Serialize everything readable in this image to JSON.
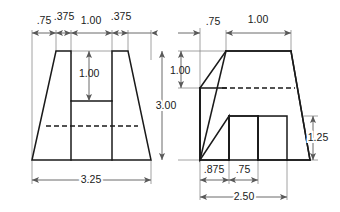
{
  "drawing": {
    "title": "Two-view orthographic dimensioned drawing",
    "units_note": "",
    "line_color": "#1a1a1a",
    "dim_color": "#595959",
    "ext_color": "#8c8c8c",
    "background": "#ffffff",
    "views": [
      {
        "id": "front-view",
        "name": "Front View",
        "description": "Trapezoid with rectangular slot cut from top center",
        "dimensions": [
          {
            "id": "fv-dim-075",
            "label": ".75",
            "orientation": "horizontal",
            "position": "top"
          },
          {
            "id": "fv-dim-375-l",
            "label": ".375",
            "orientation": "horizontal",
            "position": "top"
          },
          {
            "id": "fv-dim-100",
            "label": "1.00",
            "orientation": "horizontal",
            "position": "top"
          },
          {
            "id": "fv-dim-375-r",
            "label": ".375",
            "orientation": "horizontal",
            "position": "top"
          },
          {
            "id": "fv-dim-depth",
            "label": "1.00",
            "orientation": "vertical",
            "position": "interior"
          },
          {
            "id": "fv-dim-base",
            "label": "3.25",
            "orientation": "horizontal",
            "position": "bottom"
          }
        ]
      },
      {
        "id": "side-view",
        "name": "Side View",
        "description": "Trapezoid with step on left and rectangular notch in base",
        "dimensions": [
          {
            "id": "sv-dim-075",
            "label": ".75",
            "orientation": "horizontal",
            "position": "top"
          },
          {
            "id": "sv-dim-100-top",
            "label": "1.00",
            "orientation": "horizontal",
            "position": "top"
          },
          {
            "id": "sv-dim-100-v",
            "label": "1.00",
            "orientation": "vertical",
            "position": "left"
          },
          {
            "id": "sv-dim-300",
            "label": "3.00",
            "orientation": "vertical",
            "position": "left"
          },
          {
            "id": "sv-dim-125",
            "label": "1.25",
            "orientation": "vertical",
            "position": "right"
          },
          {
            "id": "sv-dim-0875",
            "label": ".875",
            "orientation": "horizontal",
            "position": "bottom"
          },
          {
            "id": "sv-dim-075-b",
            "label": ".75",
            "orientation": "horizontal",
            "position": "bottom"
          },
          {
            "id": "sv-dim-250",
            "label": "2.50",
            "orientation": "horizontal",
            "position": "bottom"
          }
        ]
      }
    ]
  },
  "labels": {
    "fv_075": ".75",
    "fv_375_left": ".375",
    "fv_100_top": "1.00",
    "fv_375_right": ".375",
    "fv_100_depth": "1.00",
    "fv_325": "3.25",
    "sv_075_top": ".75",
    "sv_100_top": "1.00",
    "sv_100_vert": "1.00",
    "sv_300": "3.00",
    "sv_125": "1.25",
    "sv_0875": ".875",
    "sv_075_bottom": ".75",
    "sv_250": "2.50"
  }
}
